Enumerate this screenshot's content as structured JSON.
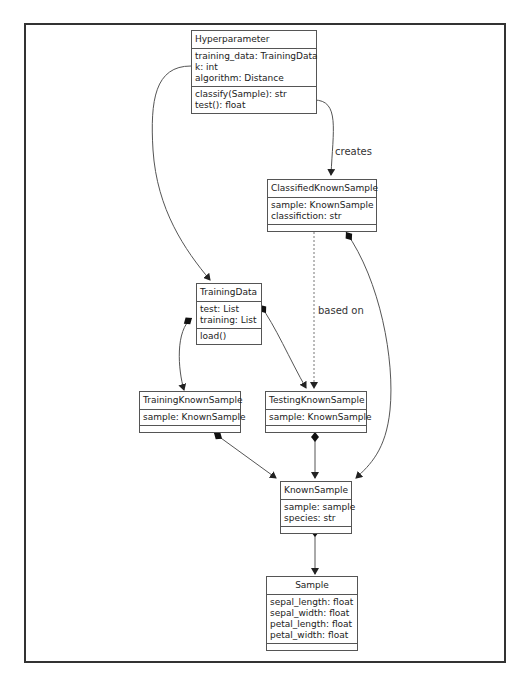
{
  "classes": {
    "hyperparameter": {
      "name": "Hyperparameter",
      "attributes": [
        "training_data: TrainingData",
        "k: int",
        "algorithm: Distance"
      ],
      "methods": [
        "classify(Sample): str",
        "test(): float"
      ]
    },
    "classified_known_sample": {
      "name": "ClassifiedKnownSample",
      "attributes": [
        "sample: KnownSample",
        "classifiction: str"
      ]
    },
    "training_data": {
      "name": "TrainingData",
      "attributes": [
        "test: List",
        "training: List"
      ],
      "methods": [
        "load()"
      ]
    },
    "training_known_sample": {
      "name": "TrainingKnownSample",
      "attributes": [
        "sample: KnownSample"
      ]
    },
    "testing_known_sample": {
      "name": "TestingKnownSample",
      "attributes": [
        "sample: KnownSample"
      ]
    },
    "known_sample": {
      "name": "KnownSample",
      "attributes": [
        "sample: sample",
        "species: str"
      ]
    },
    "sample": {
      "name": "Sample",
      "attributes": [
        "sepal_length: float",
        "sepal_width: float",
        "petal_length: float",
        "petal_width: float"
      ]
    }
  },
  "edge_labels": {
    "creates": "creates",
    "based_on": "based on"
  }
}
